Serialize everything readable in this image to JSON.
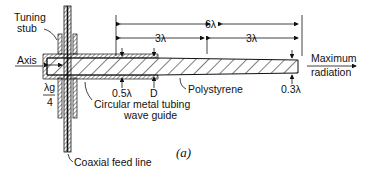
{
  "diagram": {
    "labels": {
      "tuning_stub": [
        "Tuning",
        "stub"
      ],
      "axis": "Axis",
      "guide_wavelength_num": "λg",
      "guide_wavelength_den": "4",
      "waveguide": [
        "Circular metal tubing",
        "wave guide"
      ],
      "coax": "Coaxial feed line",
      "polystyrene": "Polystyrene",
      "d_start": "0.5λ",
      "d_mid": "D",
      "d_end": "0.3λ",
      "total_length": "6λ",
      "half1": "3λ",
      "half2": "3λ",
      "output": [
        "Maximum",
        "radiation"
      ],
      "caption": "(a)"
    },
    "colors": {
      "ink": "#111111",
      "background": "#ffffff"
    }
  }
}
